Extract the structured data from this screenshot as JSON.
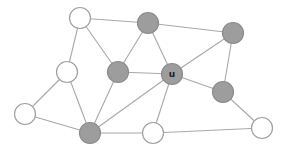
{
  "diagram": {
    "type": "graph",
    "colors": {
      "gray_node": "#9d9d9d",
      "white_node": "#ffffff",
      "edge": "#a8a8a8",
      "node_border": "#a0a0a0"
    },
    "node_radius": 10.5,
    "nodes": [
      {
        "id": "A",
        "x": 80,
        "y": 18,
        "fill": "white",
        "label": ""
      },
      {
        "id": "B",
        "x": 148,
        "y": 23,
        "fill": "gray",
        "label": ""
      },
      {
        "id": "C",
        "x": 233,
        "y": 33,
        "fill": "gray",
        "label": ""
      },
      {
        "id": "D",
        "x": 67,
        "y": 72,
        "fill": "white",
        "label": ""
      },
      {
        "id": "E",
        "x": 118,
        "y": 72,
        "fill": "gray",
        "label": ""
      },
      {
        "id": "U",
        "x": 172,
        "y": 74,
        "fill": "gray",
        "label": "u"
      },
      {
        "id": "F",
        "x": 223,
        "y": 92,
        "fill": "gray",
        "label": ""
      },
      {
        "id": "G",
        "x": 25,
        "y": 114,
        "fill": "white",
        "label": ""
      },
      {
        "id": "H",
        "x": 90,
        "y": 133,
        "fill": "gray",
        "label": ""
      },
      {
        "id": "I",
        "x": 153,
        "y": 133,
        "fill": "white",
        "label": ""
      },
      {
        "id": "J",
        "x": 262,
        "y": 128,
        "fill": "white",
        "label": ""
      }
    ],
    "edges": [
      [
        "A",
        "B"
      ],
      [
        "A",
        "D"
      ],
      [
        "A",
        "E"
      ],
      [
        "B",
        "E"
      ],
      [
        "B",
        "U"
      ],
      [
        "B",
        "C"
      ],
      [
        "C",
        "U"
      ],
      [
        "C",
        "F"
      ],
      [
        "D",
        "G"
      ],
      [
        "D",
        "H"
      ],
      [
        "E",
        "U"
      ],
      [
        "E",
        "H"
      ],
      [
        "U",
        "F"
      ],
      [
        "U",
        "H"
      ],
      [
        "U",
        "I"
      ],
      [
        "G",
        "H"
      ],
      [
        "H",
        "I"
      ],
      [
        "F",
        "J"
      ],
      [
        "I",
        "J"
      ]
    ]
  }
}
